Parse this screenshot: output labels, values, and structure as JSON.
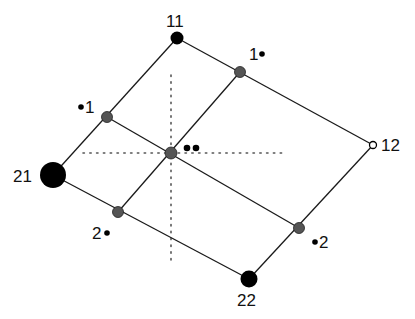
{
  "diagram": {
    "type": "lattice-parallelogram",
    "colors": {
      "edge": "#1a1a1a",
      "corner_node": "#000000",
      "mid_node": "#555555",
      "dotted_axis": "#555555",
      "text": "#111111"
    },
    "corners": [
      {
        "id": "11",
        "label": "11",
        "x": 177,
        "y": 38,
        "r": 6
      },
      {
        "id": "12",
        "label": "12",
        "x": 373,
        "y": 145,
        "r": 3.5,
        "open": true
      },
      {
        "id": "21",
        "label": "21",
        "x": 53,
        "y": 175,
        "r": 13
      },
      {
        "id": "22",
        "label": "22",
        "x": 249,
        "y": 279,
        "r": 8
      }
    ],
    "mid_nodes": [
      {
        "id": "1-top",
        "label": "1•",
        "x": 240,
        "y": 72
      },
      {
        "id": "1-left",
        "label": "•1",
        "x": 107,
        "y": 117
      },
      {
        "id": "center",
        "label": "••",
        "x": 171,
        "y": 153
      },
      {
        "id": "2-left",
        "label": "2•",
        "x": 118,
        "y": 212
      },
      {
        "id": "2-right",
        "label": "•2",
        "x": 299,
        "y": 228
      }
    ],
    "labels": {
      "n11": "11",
      "n12": "12",
      "n21": "21",
      "n22": "22",
      "one_right": "1",
      "one_left": "1",
      "two_left": "2",
      "two_right": "2"
    },
    "axes": {
      "horizontal": {
        "x1": 83,
        "x2": 287,
        "y": 153
      },
      "vertical": {
        "x": 171,
        "y1": 75,
        "y2": 265
      }
    }
  }
}
